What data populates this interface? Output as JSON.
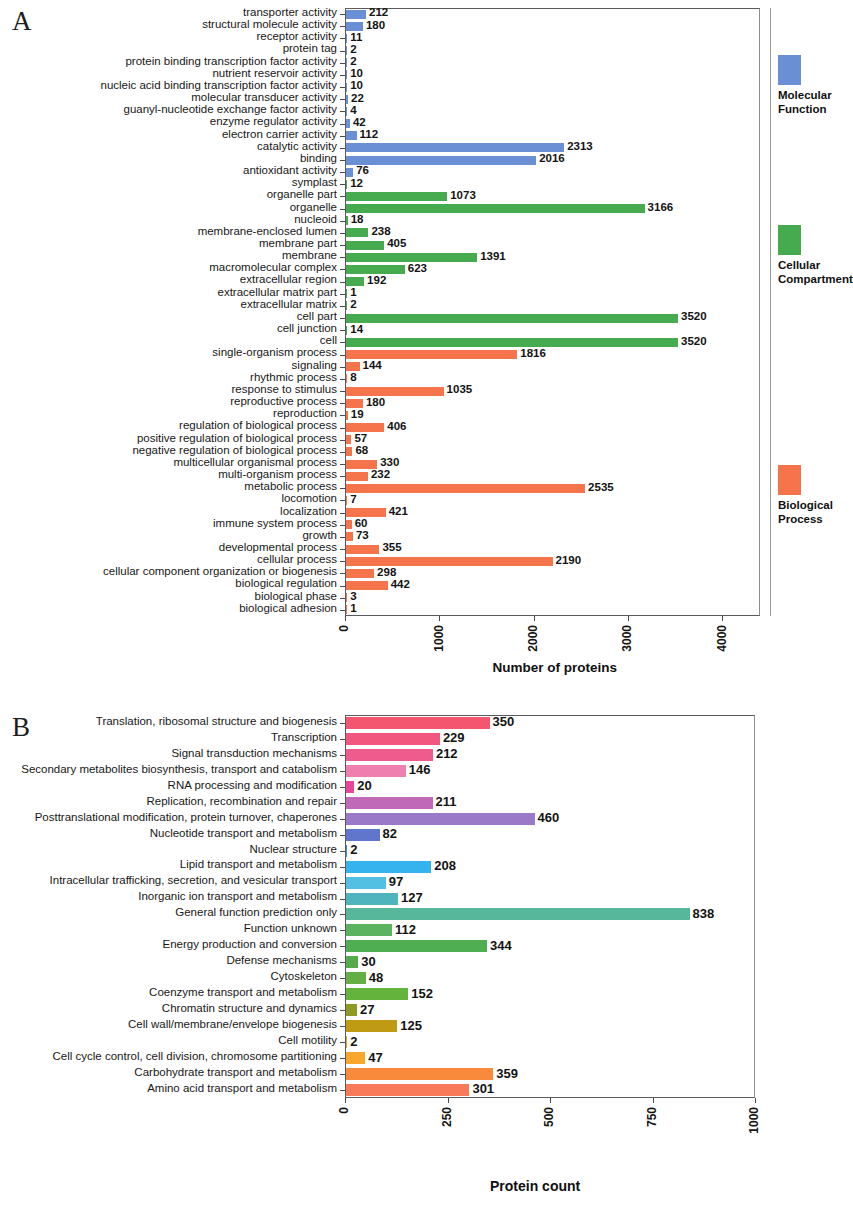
{
  "figure": {
    "panel_a_letter": "A",
    "panel_b_letter": "B"
  },
  "chart_data": [
    {
      "type": "bar",
      "orientation": "horizontal",
      "panel": "A",
      "title": "",
      "xlabel": "Number of proteins",
      "ylabel": "",
      "xlim": [
        0,
        4400
      ],
      "xticks": [
        0,
        1000,
        2000,
        3000,
        4000
      ],
      "xtick_labels": [
        "0",
        "1000",
        "2000",
        "3000",
        "4000"
      ],
      "grid": false,
      "legend_position": "right",
      "categories": [
        "transporter activity",
        "structural molecule activity",
        "receptor activity",
        "protein tag",
        "protein binding transcription factor activity",
        "nutrient reservoir activity",
        "nucleic acid binding transcription factor activity",
        "molecular transducer activity",
        "guanyl-nucleotide exchange factor activity",
        "enzyme regulator activity",
        "electron carrier activity",
        "catalytic activity",
        "binding",
        "antioxidant activity",
        "symplast",
        "organelle part",
        "organelle",
        "nucleoid",
        "membrane-enclosed lumen",
        "membrane part",
        "membrane",
        "macromolecular complex",
        "extracellular region",
        "extracellular matrix part",
        "extracellular matrix",
        "cell part",
        "cell junction",
        "cell",
        "single-organism process",
        "signaling",
        "rhythmic process",
        "response to stimulus",
        "reproductive process",
        "reproduction",
        "regulation of biological process",
        "positive regulation of biological process",
        "negative regulation of biological process",
        "multicellular organismal process",
        "multi-organism process",
        "metabolic process",
        "locomotion",
        "localization",
        "immune system process",
        "growth",
        "developmental process",
        "cellular process",
        "cellular component organization or biogenesis",
        "biological regulation",
        "biological phase",
        "biological adhesion"
      ],
      "values": [
        212,
        180,
        11,
        2,
        2,
        10,
        10,
        22,
        4,
        42,
        112,
        2313,
        2016,
        76,
        12,
        1073,
        3166,
        18,
        238,
        405,
        1391,
        623,
        192,
        1,
        2,
        3520,
        14,
        3520,
        1816,
        144,
        8,
        1035,
        180,
        19,
        406,
        57,
        68,
        330,
        232,
        2535,
        7,
        421,
        60,
        73,
        355,
        2190,
        298,
        442,
        3,
        1
      ],
      "groups": [
        {
          "name": "Molecular Function",
          "color": "#6a8fd4",
          "start": 0,
          "end": 13
        },
        {
          "name": "Cellular Compartment",
          "color": "#45ab4e",
          "start": 14,
          "end": 27
        },
        {
          "name": "Biological Process",
          "color": "#f5744b",
          "start": 28,
          "end": 49
        }
      ],
      "legend": [
        {
          "label_line1": "Molecular",
          "label_line2": "Function",
          "color": "#6a8fd4"
        },
        {
          "label_line1": "Cellular",
          "label_line2": "Compartment",
          "color": "#45ab4e"
        },
        {
          "label_line1": "Biological",
          "label_line2": "Process",
          "color": "#f5744b"
        }
      ]
    },
    {
      "type": "bar",
      "orientation": "horizontal",
      "panel": "B",
      "title": "",
      "xlabel": "Protein count",
      "ylabel": "",
      "xlim": [
        0,
        1000
      ],
      "xticks": [
        0,
        250,
        500,
        750,
        1000
      ],
      "xtick_labels": [
        "0",
        "250",
        "500",
        "750",
        "1000"
      ],
      "grid": false,
      "legend_position": "none",
      "categories": [
        "Translation, ribosomal structure and biogenesis",
        "Transcription",
        "Signal transduction mechanisms",
        "Secondary metabolites biosynthesis, transport and catabolism",
        "RNA processing and modification",
        "Replication, recombination and repair",
        "Posttranslational modification, protein turnover, chaperones",
        "Nucleotide transport and metabolism",
        "Nuclear structure",
        "Lipid transport and metabolism",
        "Intracellular trafficking, secretion, and vesicular transport",
        "Inorganic ion transport and metabolism",
        "General function prediction only",
        "Function unknown",
        "Energy production and conversion",
        "Defense mechanisms",
        "Cytoskeleton",
        "Coenzyme transport and metabolism",
        "Chromatin structure and dynamics",
        "Cell wall/membrane/envelope biogenesis",
        "Cell motility",
        "Cell cycle control, cell division, chromosome partitioning",
        "Carbohydrate transport and metabolism",
        "Amino acid transport and metabolism"
      ],
      "values": [
        350,
        229,
        212,
        146,
        20,
        211,
        460,
        82,
        2,
        208,
        97,
        127,
        838,
        112,
        344,
        30,
        48,
        152,
        27,
        125,
        2,
        47,
        359,
        301
      ],
      "colors": [
        "#f4566f",
        "#f2587f",
        "#ef5b8c",
        "#ee7fae",
        "#e8459a",
        "#c069b8",
        "#9a79c9",
        "#5f76cc",
        "#3f8ede",
        "#35b3ef",
        "#52c0e2",
        "#4fb4bd",
        "#56b79b",
        "#5cb35f",
        "#4fae52",
        "#55ab4c",
        "#63ae45",
        "#64b33c",
        "#8f9a22",
        "#bf9a13",
        "#e8a21a",
        "#f9a72c",
        "#f98a3c",
        "#f87a58"
      ]
    }
  ]
}
